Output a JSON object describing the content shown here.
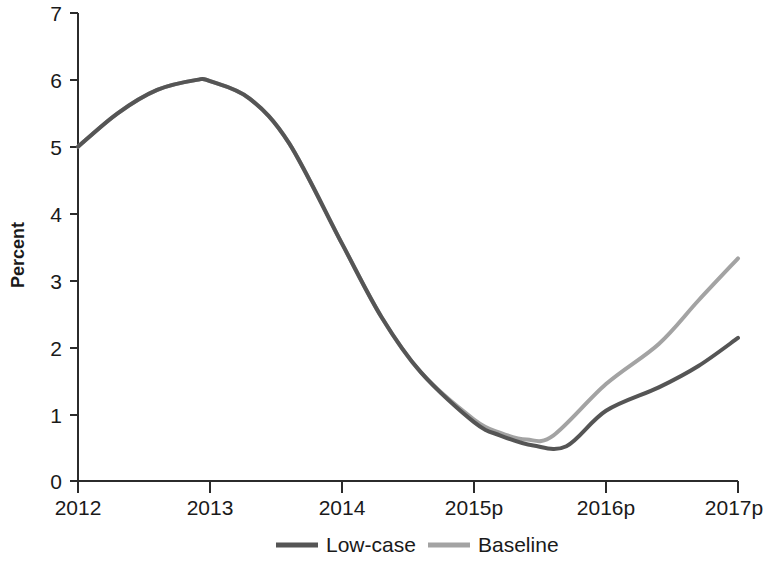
{
  "chart_data": {
    "type": "line",
    "title": "",
    "subtitle": "",
    "xlabel": "",
    "ylabel": "Percent",
    "x": [
      "2012",
      "2013",
      "2014",
      "2015p",
      "2016p",
      "2017p"
    ],
    "xticklabels": [
      "2012",
      "2013",
      "2014",
      "2015p",
      "2016p",
      "2017p"
    ],
    "yticklabels": [
      "0",
      "1",
      "2",
      "3",
      "4",
      "5",
      "6",
      "7"
    ],
    "ylim": [
      0,
      7
    ],
    "xlim": [
      2012,
      2017
    ],
    "grid": false,
    "legend_position": "bottom-center",
    "series": [
      {
        "name": "Low-case",
        "color": "#555555",
        "linewidth": 4,
        "values": [
          5.0,
          5.98,
          3.55,
          0.88,
          1.05,
          2.14
        ],
        "points": [
          {
            "x": 2012.0,
            "y": 5.0
          },
          {
            "x": 2012.3,
            "y": 5.5
          },
          {
            "x": 2012.6,
            "y": 5.85
          },
          {
            "x": 2012.9,
            "y": 6.0
          },
          {
            "x": 2013.0,
            "y": 5.98
          },
          {
            "x": 2013.3,
            "y": 5.72
          },
          {
            "x": 2013.6,
            "y": 5.05
          },
          {
            "x": 2014.0,
            "y": 3.55
          },
          {
            "x": 2014.3,
            "y": 2.45
          },
          {
            "x": 2014.6,
            "y": 1.62
          },
          {
            "x": 2015.0,
            "y": 0.88
          },
          {
            "x": 2015.2,
            "y": 0.68
          },
          {
            "x": 2015.45,
            "y": 0.53
          },
          {
            "x": 2015.7,
            "y": 0.52
          },
          {
            "x": 2016.0,
            "y": 1.05
          },
          {
            "x": 2016.4,
            "y": 1.4
          },
          {
            "x": 2016.7,
            "y": 1.72
          },
          {
            "x": 2017.0,
            "y": 2.14
          }
        ]
      },
      {
        "name": "Baseline",
        "color": "#a3a3a3",
        "linewidth": 4,
        "values": [
          5.0,
          5.98,
          3.55,
          0.92,
          1.45,
          3.33
        ],
        "points": [
          {
            "x": 2012.0,
            "y": 5.0
          },
          {
            "x": 2012.3,
            "y": 5.5
          },
          {
            "x": 2012.6,
            "y": 5.85
          },
          {
            "x": 2012.9,
            "y": 6.0
          },
          {
            "x": 2013.0,
            "y": 5.98
          },
          {
            "x": 2013.3,
            "y": 5.72
          },
          {
            "x": 2013.6,
            "y": 5.05
          },
          {
            "x": 2014.0,
            "y": 3.55
          },
          {
            "x": 2014.3,
            "y": 2.45
          },
          {
            "x": 2014.6,
            "y": 1.62
          },
          {
            "x": 2015.0,
            "y": 0.92
          },
          {
            "x": 2015.2,
            "y": 0.72
          },
          {
            "x": 2015.4,
            "y": 0.62
          },
          {
            "x": 2015.6,
            "y": 0.68
          },
          {
            "x": 2016.0,
            "y": 1.45
          },
          {
            "x": 2016.4,
            "y": 2.05
          },
          {
            "x": 2016.7,
            "y": 2.7
          },
          {
            "x": 2017.0,
            "y": 3.33
          }
        ]
      }
    ],
    "legend": [
      {
        "label": "Low-case",
        "color": "#555555"
      },
      {
        "label": "Baseline",
        "color": "#a3a3a3"
      }
    ]
  },
  "axes": {
    "y_title": "Percent",
    "y_ticks": [
      "7",
      "6",
      "5",
      "4",
      "3",
      "2",
      "1",
      "0"
    ],
    "x_ticks": [
      "2012",
      "2013",
      "2014",
      "2015p",
      "2016p",
      "2017p"
    ]
  },
  "legend_items": {
    "low_case_label": "Low-case",
    "baseline_label": "Baseline"
  },
  "colors": {
    "low_case": "#555555",
    "baseline": "#a3a3a3",
    "axis": "#2b2b2b",
    "text": "#1a1a1a",
    "background": "#ffffff"
  }
}
